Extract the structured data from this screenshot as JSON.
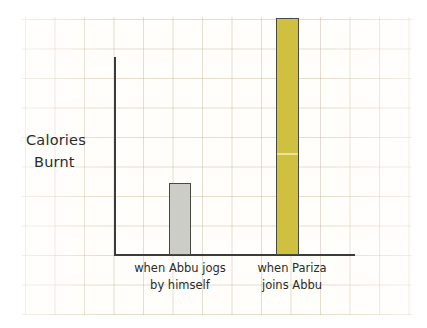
{
  "chart_data": {
    "type": "bar",
    "title": "",
    "subtitle": "",
    "xlabel": "",
    "ylabel_line1": "Calories",
    "ylabel_line2": "Burnt",
    "ylabel": "Calories Burnt",
    "categories": [
      "when Abbu jogs by himself",
      "when Pariza joins Abbu"
    ],
    "category_lines": [
      {
        "line1": "when Abbu jogs",
        "line2": "by himself"
      },
      {
        "line1": "when Pariza",
        "line2": "joins Abbu"
      }
    ],
    "values": [
      72,
      237
    ],
    "value_unit": "relative bar height (px)",
    "ylim": [
      0,
      250
    ],
    "tick_labels": [],
    "grid": true,
    "grid_style": "graph-paper",
    "legend": false,
    "legend_position": "none",
    "annotations": [],
    "bar_colors": [
      "#cdcdc8",
      "#cfc13f"
    ],
    "bar_outline_color": "#4a4a44",
    "axis_color": "#3b3b3b",
    "paper_color": "#fffefb",
    "grid_color": "#c6b498",
    "text_color": "#2b2b2b"
  }
}
